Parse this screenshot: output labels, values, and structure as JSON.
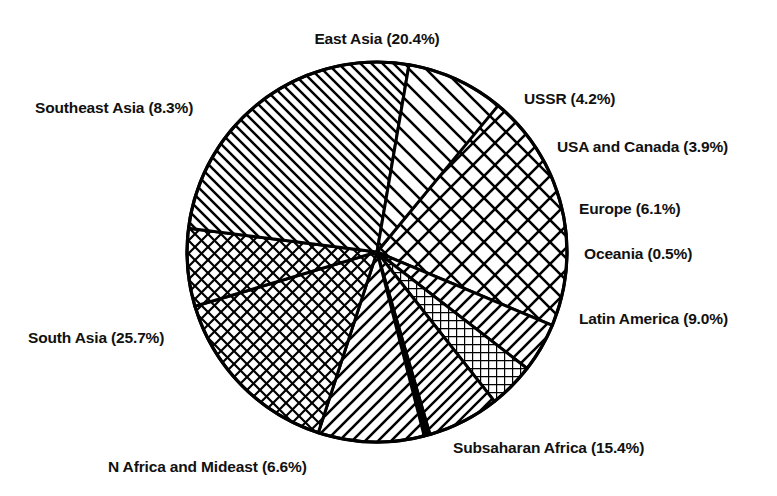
{
  "chart_data": {
    "type": "pie",
    "title": "",
    "subtitle": "",
    "xlabel": "",
    "ylabel": "",
    "legend_position": "outside-labels",
    "grid": false,
    "value_unit": "percent",
    "start_angle_deg": 0,
    "direction": "clockwise",
    "center": {
      "x": 377,
      "y": 252
    },
    "radius": 190,
    "categories": [
      "East Asia",
      "USSR",
      "USA and Canada",
      "Europe",
      "Oceania",
      "Latin America",
      "Subsaharan Africa",
      "N Africa and Mideast",
      "South Asia",
      "Southeast Asia"
    ],
    "values": [
      20.4,
      4.2,
      3.9,
      6.1,
      0.5,
      9.0,
      15.4,
      6.6,
      25.7,
      8.3
    ],
    "labels": [
      "East Asia (20.4%)",
      "USSR (4.2%)",
      "USA and Canada (3.9%)",
      "Europe (6.1%)",
      "Oceania (0.5%)",
      "Latin America (9.0%)",
      "Subsaharan Africa (15.4%)",
      "N Africa and Mideast (6.6%)",
      "South Asia (25.7%)",
      "Southeast Asia (8.3%)"
    ],
    "slices": [
      {
        "name": "East Asia",
        "value": 20.4,
        "label": "East Asia (20.4%)",
        "pattern": "diamond-crosshatch-large",
        "start_deg": 309.3,
        "end_deg": 382.7
      },
      {
        "name": "USSR",
        "value": 4.2,
        "label": "USSR (4.2%)",
        "pattern": "diagonal-forward-wide",
        "start_deg": 382.7,
        "end_deg": 397.8
      },
      {
        "name": "USA and Canada",
        "value": 3.9,
        "label": "USA and Canada (3.9%)",
        "pattern": "grid-crosshatch-fine",
        "start_deg": 397.8,
        "end_deg": 411.8
      },
      {
        "name": "Europe",
        "value": 6.1,
        "label": "Europe (6.1%)",
        "pattern": "diagonal-forward-medium",
        "start_deg": 411.8,
        "end_deg": 433.8
      },
      {
        "name": "Oceania",
        "value": 0.5,
        "label": "Oceania (0.5%)",
        "pattern": "solid-sliver",
        "start_deg": 433.8,
        "end_deg": 435.6
      },
      {
        "name": "Latin America",
        "value": 9.0,
        "label": "Latin America (9.0%)",
        "pattern": "diagonal-forward-wide",
        "start_deg": 435.6,
        "end_deg": 468.0
      },
      {
        "name": "Subsaharan Africa",
        "value": 15.4,
        "label": "Subsaharan Africa (15.4%)",
        "pattern": "diamond-crosshatch-medium",
        "start_deg": 468.0,
        "end_deg": 523.4
      },
      {
        "name": "N Africa and Mideast",
        "value": 6.6,
        "label": "N Africa and Mideast (6.6%)",
        "pattern": "diamond-crosshatch-medium",
        "start_deg": 523.4,
        "end_deg": 547.2
      },
      {
        "name": "South Asia",
        "value": 25.7,
        "label": "South Asia (25.7%)",
        "pattern": "diagonal-back-dense",
        "start_deg": 547.2,
        "end_deg": 639.7
      },
      {
        "name": "Southeast Asia",
        "value": 8.3,
        "label": "Southeast Asia (8.3%)",
        "pattern": "diagonal-back-wide",
        "start_deg": 639.7,
        "end_deg": 669.6
      }
    ],
    "colors": {
      "stroke": "#000000",
      "fill": "#ffffff",
      "background": "#ffffff",
      "text": "#111111"
    }
  }
}
